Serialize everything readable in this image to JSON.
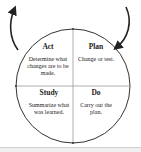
{
  "diagram": {
    "type": "PDSA cycle",
    "quadrants": {
      "act": {
        "title": "Act",
        "description": "Determine what changes are to be made."
      },
      "plan": {
        "title": "Plan",
        "description": "Change or test."
      },
      "study": {
        "title": "Study",
        "description": "Summarize what was learned."
      },
      "do": {
        "title": "Do",
        "description": "Carry out the plan."
      }
    },
    "colors": {
      "line": "#333333",
      "axis": "#999999"
    }
  }
}
